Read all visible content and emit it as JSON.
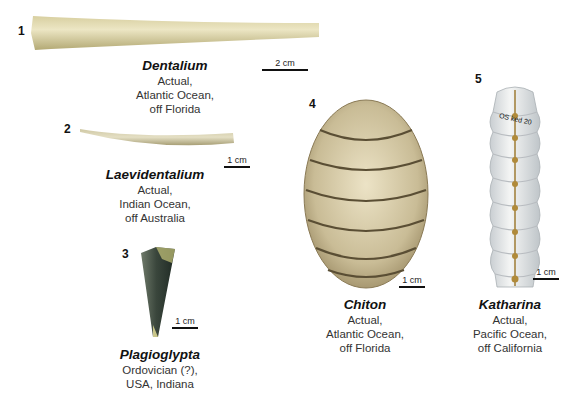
{
  "figure": {
    "specimens": [
      {
        "number": "1",
        "name": "Dentalium",
        "lines": [
          "Actual,",
          "Atlantic Ocean,",
          "off Florida"
        ],
        "scale": "2 cm"
      },
      {
        "number": "2",
        "name": "Laevidentalium",
        "lines": [
          "Actual,",
          "Indian Ocean,",
          "off Australia"
        ],
        "scale": "1 cm"
      },
      {
        "number": "3",
        "name": "Plagioglypta",
        "lines": [
          "Ordovician (?),",
          "USA, Indiana"
        ],
        "scale": "1 cm"
      },
      {
        "number": "4",
        "name": "Chiton",
        "lines": [
          "Actual,",
          "Atlantic Ocean,",
          "off Florida"
        ],
        "scale": "1 cm"
      },
      {
        "number": "5",
        "name": "Katharina",
        "lines": [
          "Actual,",
          "Pacific Ocean,",
          "off California"
        ],
        "scale": "1 cm",
        "label_on_shell": "OS ked 20"
      }
    ],
    "colors": {
      "tusk_shell": "#e4dcae",
      "tusk_shadow": "#b8ad78",
      "fossil": "#3c4a3e",
      "chiton": "#cfc3a0",
      "chiton_groove": "#5a4e34",
      "katharina": "#eef0ee",
      "katharina_seam": "#a88a4a"
    }
  }
}
